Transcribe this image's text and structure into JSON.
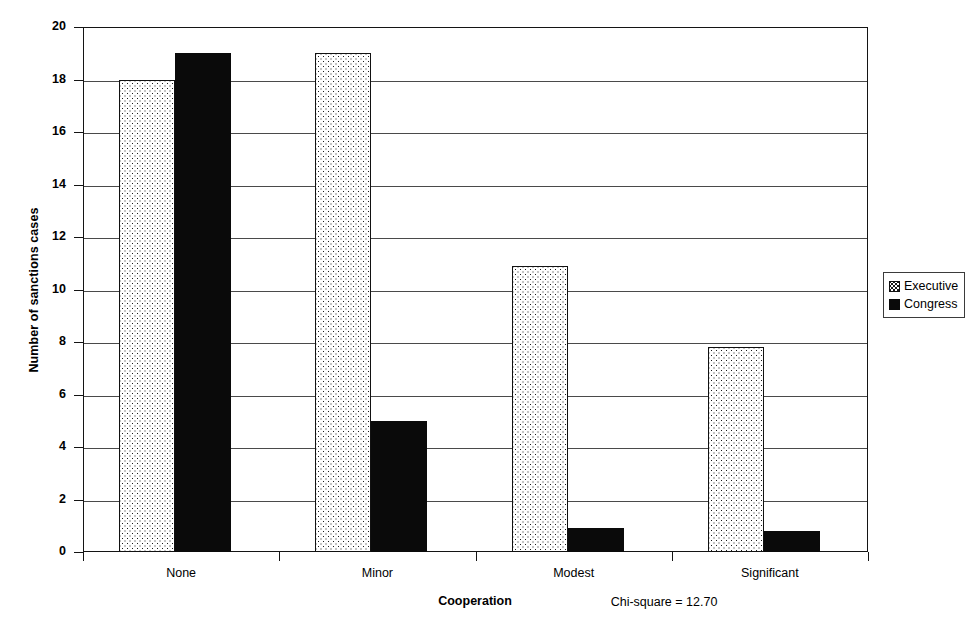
{
  "chart_data": {
    "type": "bar",
    "title": "",
    "xlabel": "Cooperation",
    "ylabel": "Number of sanctions cases",
    "categories": [
      "None",
      "Minor",
      "Modest",
      "Significant"
    ],
    "series": [
      {
        "name": "Executive",
        "values": [
          18,
          19,
          10.9,
          7.8
        ],
        "pattern": "dotted"
      },
      {
        "name": "Congress",
        "values": [
          19,
          5,
          0.9,
          0.8
        ],
        "pattern": "solid-black"
      }
    ],
    "ylim": [
      0,
      20
    ],
    "y_ticks": [
      0,
      2,
      4,
      6,
      8,
      10,
      12,
      14,
      16,
      18,
      20
    ],
    "grid": true,
    "legend_position": "right",
    "annotation": "Chi-square = 12.70"
  },
  "legend": {
    "items": [
      {
        "label": "Executive",
        "swatch": "dotted-square-icon"
      },
      {
        "label": "Congress",
        "swatch": "filled-square-icon"
      }
    ]
  },
  "axes": {
    "y_title": "Number of sanctions cases",
    "x_title": "Cooperation",
    "y_tick_labels": [
      "0",
      "2",
      "4",
      "6",
      "8",
      "10",
      "12",
      "14",
      "16",
      "18",
      "20"
    ],
    "x_tick_labels": [
      "None",
      "Minor",
      "Modest",
      "Significant"
    ]
  },
  "annotation": {
    "text": "Chi-square = 12.70"
  }
}
